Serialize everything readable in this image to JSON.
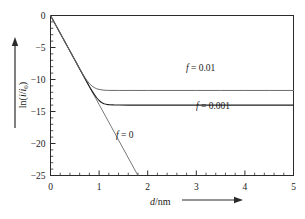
{
  "chart_data": {
    "type": "line",
    "title": "",
    "subtitle": "",
    "xlabel": "d/nm",
    "ylabel": "ln(i/i0)",
    "xlabel_html": "<span class=\"ital\">d</span>/nm",
    "ylabel_html": "ln(<span class=\"ital\">i</span>/<span class=\"ital\">i</span><span class=\"sub\">0</span>)",
    "xlim": [
      0,
      5
    ],
    "ylim": [
      -25,
      0
    ],
    "xticks": [
      0,
      1,
      2,
      3,
      4,
      5
    ],
    "xtick_labels": [
      "0",
      "1",
      "2",
      "3",
      "4",
      "5"
    ],
    "yticks": [
      0,
      -5,
      -10,
      -15,
      -20,
      -25
    ],
    "ytick_labels": [
      "0",
      "-5",
      "-10",
      "-15",
      "-20",
      "-25"
    ],
    "x_minor_ticks_per_interval": 5,
    "y_minor_ticks_per_interval": 5,
    "grid": false,
    "legend_position": "inline-annotations",
    "axis_arrows": {
      "x": true,
      "y": true
    },
    "series": [
      {
        "name": "f = 0",
        "label": "f = 0",
        "label_html": "<span class=\"ital\">f</span> = 0",
        "color": "#555555",
        "width": 0.8,
        "plateau": null,
        "slope": -13.9,
        "x": [
          0,
          0.25,
          0.5,
          0.75,
          1.0,
          1.25,
          1.5,
          1.7986
        ],
        "y": [
          0,
          -3.475,
          -6.95,
          -10.425,
          -13.9,
          -17.375,
          -20.85,
          -25.0
        ]
      },
      {
        "name": "f = 0.001",
        "label": "f = 0.001",
        "label_html": "<span class=\"ital\">f</span> = 0.001",
        "color": "#1f1f1f",
        "width": 1.1,
        "plateau": -13.8,
        "slope": -13.9,
        "x": [
          0,
          0.2,
          0.4,
          0.6,
          0.7,
          0.8,
          0.85,
          0.9,
          0.95,
          1.0,
          1.05,
          1.1,
          1.15,
          1.2,
          1.3,
          1.4,
          1.6,
          2.0,
          2.5,
          3.0,
          3.5,
          4.0,
          4.5,
          5.0
        ],
        "y": [
          0,
          -2.78,
          -5.56,
          -8.34,
          -9.73,
          -11.1,
          -11.74,
          -12.33,
          -12.85,
          -13.28,
          -13.6,
          -13.8,
          -13.88,
          -13.93,
          -13.97,
          -13.99,
          -14.0,
          -14.0,
          -14.0,
          -14.0,
          -14.0,
          -14.0,
          -14.0,
          -14.0
        ]
      },
      {
        "name": "f = 0.01",
        "label": "f = 0.01",
        "label_html": "<span class=\"ital\">f</span> = 0.01",
        "color": "#6b6b6b",
        "width": 1.0,
        "plateau": -11.5,
        "slope": -13.9,
        "x": [
          0,
          0.15,
          0.3,
          0.45,
          0.6,
          0.7,
          0.75,
          0.8,
          0.85,
          0.9,
          0.95,
          1.0,
          1.1,
          1.2,
          1.4,
          1.7,
          2.0,
          2.5,
          3.0,
          3.5,
          4.0,
          4.5,
          5.0
        ],
        "y": [
          0,
          -2.08,
          -4.17,
          -6.25,
          -8.33,
          -9.6,
          -10.15,
          -10.62,
          -11.0,
          -11.26,
          -11.44,
          -11.55,
          -11.67,
          -11.7,
          -11.71,
          -11.71,
          -11.71,
          -11.71,
          -11.71,
          -11.71,
          -11.71,
          -11.71,
          -11.71
        ]
      }
    ],
    "annotations": [
      {
        "text": "f = 0.01",
        "x": 3.1,
        "y": -9.3
      },
      {
        "text": "f = 0.001",
        "x": 3.4,
        "y": -15.2
      },
      {
        "text": "f = 0",
        "x": 1.35,
        "y": -19.6
      }
    ]
  },
  "colors": {
    "frame": "#2b2b2b",
    "text": "#1a1a1a",
    "background": "#ffffff"
  }
}
